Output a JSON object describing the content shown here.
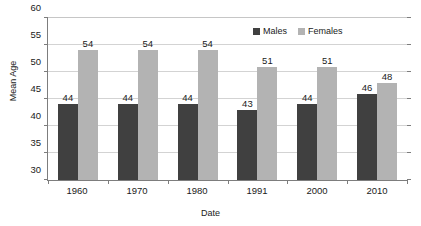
{
  "chart_data": {
    "type": "bar",
    "title": "",
    "xlabel": "Date",
    "ylabel": "Mean Age",
    "categories": [
      "1960",
      "1970",
      "1980",
      "1991",
      "2000",
      "2010"
    ],
    "series": [
      {
        "name": "Males",
        "color": "#404040",
        "values": [
          44,
          44,
          44,
          43,
          44,
          46
        ]
      },
      {
        "name": "Females",
        "color": "#b3b3b3",
        "values": [
          54,
          54,
          54,
          51,
          51,
          48
        ]
      }
    ],
    "ylim": [
      30,
      60
    ],
    "yticks": [
      30,
      35,
      40,
      45,
      50,
      55,
      60
    ],
    "ytick_labels": [
      "30",
      "35",
      "40",
      "45",
      "50",
      "55",
      "60"
    ],
    "grid": true,
    "legend_position": "top-right",
    "data_labels": true
  },
  "axes": {
    "y_title": "Mean Age",
    "x_title": "Date"
  },
  "legend": {
    "entries": [
      {
        "label": "Males"
      },
      {
        "label": "Females"
      }
    ]
  },
  "colors": {
    "males": "#404040",
    "females": "#b3b3b3",
    "grid": "#d3d3d3",
    "axis": "#7d7d7d",
    "background": "#ffffff",
    "text": "#1a1a1a"
  }
}
